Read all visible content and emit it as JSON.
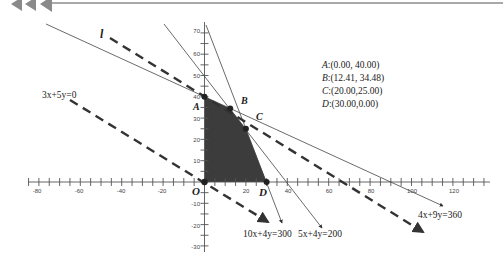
{
  "header": {
    "decoration": "triple-left-arrow-banner",
    "arrow_color": "#8a8a8a",
    "rule_color": "#555555"
  },
  "chart_data": {
    "type": "linear-programming-diagram",
    "title": "",
    "xlabel": "",
    "ylabel": "",
    "xlim": [
      -85,
      135
    ],
    "ylim": [
      -33,
      73
    ],
    "x_ticks": [
      -80,
      -60,
      -40,
      -20,
      20,
      40,
      60,
      80,
      100,
      120
    ],
    "y_ticks": [
      -30,
      -20,
      -10,
      10,
      20,
      30,
      40,
      50,
      60,
      70
    ],
    "x_tick_labels": [
      "-80",
      "-60",
      "-40",
      "-20",
      "20",
      "40",
      "60",
      "80",
      "100",
      "120"
    ],
    "y_tick_labels": [
      "-30",
      "-20",
      "-10",
      "10",
      "20",
      "30",
      "40",
      "50",
      "60",
      "70"
    ],
    "origin_label": "O",
    "constraints": [
      {
        "label": "4x+9y=360",
        "style": "solid",
        "x_intercept": 90,
        "y_intercept": 40
      },
      {
        "label": "5x+4y=200",
        "style": "solid",
        "x_intercept": 40,
        "y_intercept": 50
      },
      {
        "label": "10x+4y=300",
        "style": "solid",
        "x_intercept": 30,
        "y_intercept": 75
      }
    ],
    "objective_lines": [
      {
        "label": "3x+5y=0",
        "style": "dashed"
      },
      {
        "label": "l",
        "style": "dashed",
        "through_point": "B"
      }
    ],
    "feasible_region": {
      "vertices": [
        [
          0,
          0
        ],
        [
          0,
          40
        ],
        [
          12.41,
          34.48
        ],
        [
          20,
          25
        ],
        [
          30,
          0
        ]
      ],
      "fill": "#3a3a3a"
    },
    "points": [
      {
        "name": "A",
        "x": 0.0,
        "y": 40.0,
        "text": "A:(0.00, 40.00)"
      },
      {
        "name": "B",
        "x": 12.41,
        "y": 34.48,
        "text": "B:(12.41, 34.48)"
      },
      {
        "name": "C",
        "x": 20.0,
        "y": 25.0,
        "text": "C:(20.00,25.00)"
      },
      {
        "name": "D",
        "x": 30.0,
        "y": 0.0,
        "text": "D:(30.00,0.00)"
      }
    ],
    "grid": false,
    "legend": "none"
  },
  "labels": {
    "origin": "O",
    "point_a": "A",
    "point_b": "B",
    "point_c": "C",
    "point_d": "D",
    "line_l": "l",
    "eq_obj0": "3x+5y=0",
    "eq_c1": "4x+9y=360",
    "eq_c2": "10x+4y=300",
    "eq_c3": "5x+4y=200"
  },
  "coords_box": {
    "a": {
      "name": "A",
      "value": ":(0.00, 40.00)"
    },
    "b": {
      "name": "B",
      "value": ":(12.41, 34.48)"
    },
    "c": {
      "name": "C",
      "value": ":(20.00,25.00)"
    },
    "d": {
      "name": "D",
      "value": ":(30.00,0.00)"
    }
  },
  "x_ticks": [
    "-80",
    "-60",
    "-40",
    "-20",
    "20",
    "40",
    "60",
    "80",
    "100",
    "120"
  ],
  "y_ticks": [
    "70",
    "60",
    "50",
    "40",
    "30",
    "20",
    "10",
    "-10",
    "-20",
    "-30"
  ]
}
